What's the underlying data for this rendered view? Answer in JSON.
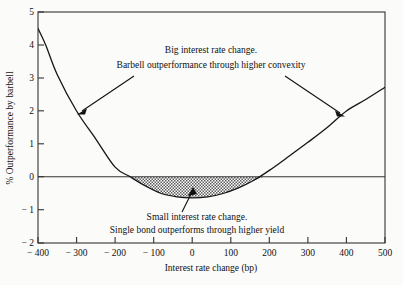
{
  "chart_data": {
    "type": "line",
    "title": "",
    "xlabel": "Interest rate change (bp)",
    "ylabel": "% Outperformance by barbell",
    "xlim": [
      -400,
      500
    ],
    "ylim": [
      -2,
      5
    ],
    "grid": false,
    "legend": null,
    "xticks": [
      -400,
      -300,
      -200,
      -100,
      0,
      100,
      200,
      300,
      400,
      500
    ],
    "xtick_labels": [
      "− 400",
      "− 300",
      "− 200",
      "− 100",
      "0",
      "100",
      "200",
      "300",
      "400",
      "500"
    ],
    "yticks": [
      -2,
      -1,
      0,
      1,
      2,
      3,
      4,
      5
    ],
    "ytick_labels": [
      "− 2",
      "− 1",
      "0",
      "1",
      "2",
      "3",
      "4",
      "5"
    ],
    "series": [
      {
        "name": "Barbell outperformance",
        "x": [
          -400,
          -380,
          -350,
          -300,
          -250,
          -200,
          -160,
          -120,
          -80,
          -40,
          0,
          40,
          80,
          120,
          160,
          200,
          250,
          300,
          350,
          400,
          450,
          500
        ],
        "values": [
          4.5,
          4.0,
          3.1,
          2.0,
          1.15,
          0.3,
          0.0,
          -0.28,
          -0.5,
          -0.6,
          -0.63,
          -0.6,
          -0.5,
          -0.33,
          -0.1,
          0.2,
          0.62,
          1.05,
          1.5,
          2.0,
          2.35,
          2.72
        ]
      }
    ],
    "shaded_region": {
      "label": "negative outperformance area",
      "x_start": -160,
      "x_end": 185,
      "baseline": 0,
      "fill": "hatched-gray"
    },
    "annotations": [
      {
        "id": "upper",
        "line1": "Big interest rate change.",
        "line2": "Barbell outperformance through higher convexity",
        "points_to": [
          [
            -300,
            2.0
          ],
          [
            390,
            2.0
          ]
        ]
      },
      {
        "id": "lower",
        "line1": "Small interest rate change.",
        "line2": "Single bond outperforms through higher yield",
        "points_to": [
          [
            -20,
            -0.62
          ]
        ]
      }
    ],
    "zero_reference_line": 0
  },
  "colors": {
    "curve": "#151515",
    "axis": "#333333",
    "text": "#111111",
    "background": "#fbfbf9",
    "shade": "#6b6b6b"
  },
  "axes": {
    "x_title": "Interest rate change (bp)",
    "y_title": "% Outperformance by barbell"
  }
}
